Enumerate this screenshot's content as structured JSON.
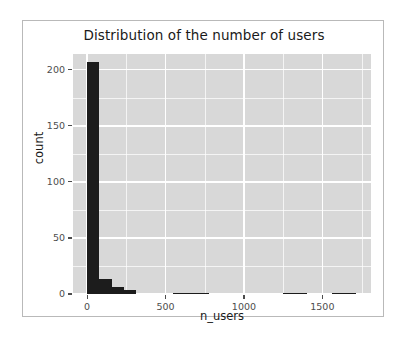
{
  "figure": {
    "background": "#ffffff",
    "panel_background": "#d8d8d8",
    "grid_color": "#ffffff",
    "bar_color": "#1c1c1c",
    "axis_text_color": "#4d4d4d",
    "title_color": "#1a1a1a"
  },
  "chart_data": {
    "type": "bar",
    "title": "Distribution of the number of users",
    "xlabel": "n_users",
    "ylabel": "count",
    "grid": true,
    "legend": null,
    "xlim": [
      -90,
      1810
    ],
    "ylim": [
      0,
      214
    ],
    "xticks": [
      0,
      500,
      1000,
      1500
    ],
    "xtick_labels": [
      "0",
      "500",
      "1000",
      "1500"
    ],
    "yticks": [
      0,
      50,
      100,
      150,
      200
    ],
    "ytick_labels": [
      "0",
      "50",
      "100",
      "150",
      "200"
    ],
    "x_minor_ticks": [
      250,
      750,
      1250,
      1750
    ],
    "y_minor_ticks": [
      25,
      75,
      125,
      175
    ],
    "binwidth": 78,
    "bin_starts": [
      0,
      78,
      156,
      234,
      312,
      390,
      468,
      546,
      624,
      702,
      780,
      858,
      936,
      1014,
      1092,
      1170,
      1248,
      1326,
      1404,
      1482,
      1560,
      1638,
      1716
    ],
    "values": [
      207,
      13,
      6,
      4,
      0,
      0,
      0,
      1,
      1,
      1,
      0,
      0,
      0,
      0,
      0,
      0,
      1,
      1,
      0,
      0,
      1,
      1,
      0
    ],
    "categories": [
      "0-78",
      "78-156",
      "156-234",
      "234-312",
      "312-390",
      "390-468",
      "468-546",
      "546-624",
      "624-702",
      "702-780",
      "780-858",
      "858-936",
      "936-1014",
      "1014-1092",
      "1092-1170",
      "1170-1248",
      "1248-1326",
      "1326-1404",
      "1404-1482",
      "1482-1560",
      "1560-1638",
      "1638-1716",
      "1716-1794"
    ]
  }
}
